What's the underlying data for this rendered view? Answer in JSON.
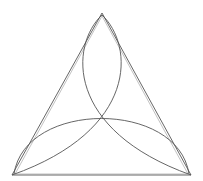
{
  "diagram": {
    "stroke_color": "#555555",
    "background": "#ffffff",
    "triangle": {
      "apex": [
        102,
        13
      ],
      "bottom_left": [
        12,
        175
      ],
      "bottom_right": [
        191,
        175
      ]
    },
    "arcs": [
      {
        "name": "vertical-lobe-left",
        "from": [
          102,
          13
        ],
        "to": [
          191,
          175
        ]
      },
      {
        "name": "vertical-lobe-right",
        "from": [
          102,
          13
        ],
        "to": [
          12,
          175
        ]
      },
      {
        "name": "bottom-lobe",
        "from": [
          12,
          175
        ],
        "to": [
          191,
          175
        ]
      }
    ]
  }
}
